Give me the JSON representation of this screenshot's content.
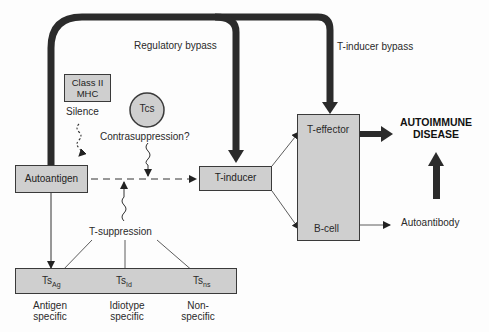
{
  "diagram": {
    "nodes": {
      "class_ii_mhc": {
        "line1": "Class II",
        "line2": "MHC"
      },
      "tcs": "Tcs",
      "autoantigen": "Autoantigen",
      "t_inducer": "T-inducer",
      "t_effector": "T-effector",
      "b_cell": "B-cell",
      "ts_ag": {
        "base": "Ts",
        "sub": "Ag"
      },
      "ts_id": {
        "base": "Ts",
        "sub": "Id"
      },
      "ts_ns": {
        "base": "Ts",
        "sub": "ns"
      }
    },
    "labels": {
      "regulatory_bypass": "Regulatory bypass",
      "t_inducer_bypass": "T-inducer bypass",
      "silence": "Silence",
      "contrasuppression": "Contrasuppression?",
      "t_suppression": "T-suppression",
      "autoimmune_line1": "AUTOIMMUNE",
      "autoimmune_line2": "DISEASE",
      "autoantibody": "Autoantibody",
      "antigen_specific": {
        "line1": "Antigen",
        "line2": "specific"
      },
      "idiotype_specific": {
        "line1": "Idiotype",
        "line2": "specific"
      },
      "non_specific": {
        "line1": "Non-",
        "line2": "specific"
      }
    },
    "colors": {
      "box_fill": "#cfcfcf",
      "stroke": "#333333",
      "thick_arrow": "#2b2b2b"
    }
  }
}
